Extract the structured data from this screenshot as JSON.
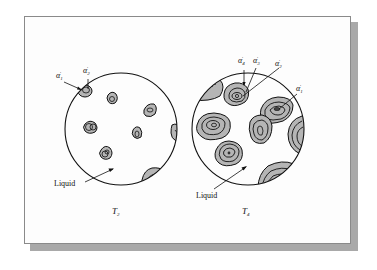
{
  "figure": {
    "panels": [
      {
        "id": "T2",
        "temperature_label": "T",
        "temperature_sub": "2",
        "liquid_label": "Liquid",
        "annotations": [
          {
            "symbol": "α",
            "sub": "1",
            "prime": "′"
          },
          {
            "symbol": "α",
            "sub": "2",
            "prime": "′"
          }
        ]
      },
      {
        "id": "T4",
        "temperature_label": "T",
        "temperature_sub": "4",
        "liquid_label": "Liquid",
        "annotations": [
          {
            "symbol": "α",
            "sub": "4",
            "prime": "′"
          },
          {
            "symbol": "α",
            "sub": "3",
            "prime": "′"
          },
          {
            "symbol": "α",
            "sub": "2",
            "prime": "′"
          },
          {
            "symbol": "α",
            "sub": "1",
            "prime": "′"
          }
        ]
      }
    ],
    "colors": {
      "grain_fill": "#b5b5b5",
      "outline": "#111111",
      "frame_shadow": "#a9a9a9"
    }
  }
}
